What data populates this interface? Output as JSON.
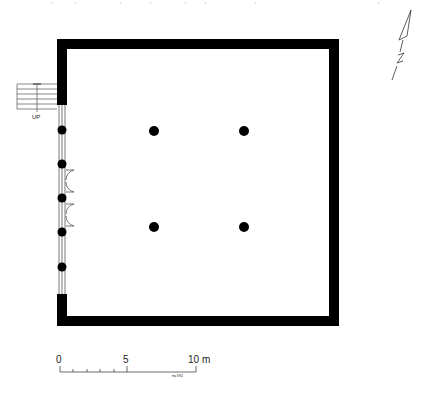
{
  "plan": {
    "stair_label": "UP",
    "north_label": "N",
    "scale": {
      "ticks": [
        "0",
        "5",
        "10 m"
      ],
      "note": "ma 9/92"
    },
    "columns": [
      {
        "x": 154,
        "y": 131
      },
      {
        "x": 244,
        "y": 131
      },
      {
        "x": 154,
        "y": 227
      },
      {
        "x": 244,
        "y": 227
      }
    ],
    "colors": {
      "wall": "#000000",
      "line": "#333333",
      "background": "#ffffff"
    }
  }
}
